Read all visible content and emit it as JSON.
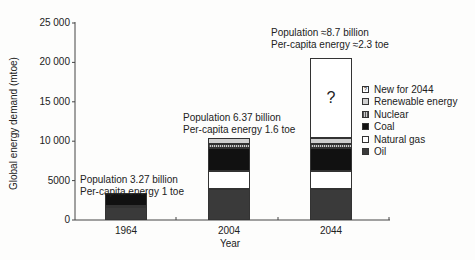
{
  "chart_data": {
    "type": "bar",
    "stacked": true,
    "title": "",
    "xlabel": "Year",
    "ylabel": "Global energy demand (mtoe)",
    "ylim": [
      0,
      25000
    ],
    "yticks": [
      "0",
      "5000",
      "10 000",
      "15 000",
      "20 000",
      "25 000"
    ],
    "categories": [
      "1964",
      "2004",
      "2044"
    ],
    "series": [
      {
        "name": "Oil",
        "values": [
          1600,
          3900,
          3900
        ],
        "color": "#3a3a3a"
      },
      {
        "name": "Natural gas",
        "values": [
          200,
          2300,
          2300
        ],
        "color": "#ffffff"
      },
      {
        "name": "Coal",
        "values": [
          1600,
          3000,
          3000
        ],
        "color": "#111111"
      },
      {
        "name": "Nuclear",
        "values": [
          0,
          500,
          500
        ],
        "color": "#9a9a9a"
      },
      {
        "name": "Renewable energy",
        "values": [
          0,
          700,
          700
        ],
        "color": "#cfcfcf"
      },
      {
        "name": "New for 2044",
        "values": [
          0,
          0,
          10100
        ],
        "color": "#ffffff"
      }
    ],
    "annotations": [
      {
        "category": "1964",
        "lines": [
          "Population 3.27 billion",
          "Per-capita energy 1 toe"
        ]
      },
      {
        "category": "2004",
        "lines": [
          "Population 6.37 billion",
          "Per-capita energy 1.6 toe"
        ]
      },
      {
        "category": "2044",
        "lines": [
          "Population ≈8.7 billion",
          "Per-capita energy ≈2.3 toe"
        ]
      }
    ],
    "question_mark": "?",
    "legend_position": "right",
    "grid": false
  },
  "legend": [
    "New for 2044",
    "Renewable energy",
    "Nuclear",
    "Coal",
    "Natural gas",
    "Oil"
  ]
}
